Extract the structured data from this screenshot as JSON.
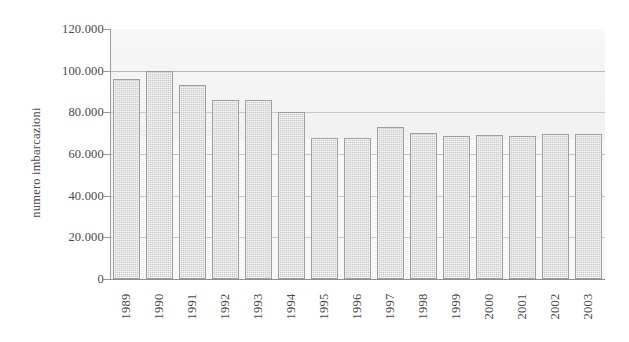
{
  "chart_data": {
    "type": "bar",
    "title": "",
    "subtitle": "",
    "xlabel": "",
    "ylabel": "numero imbarcazioni",
    "categories": [
      "1989",
      "1990",
      "1991",
      "1992",
      "1993",
      "1994",
      "1995",
      "1996",
      "1997",
      "1998",
      "1999",
      "2000",
      "2001",
      "2002",
      "2003"
    ],
    "values": [
      96000,
      100000,
      93000,
      86000,
      86000,
      80000,
      67500,
      67500,
      73000,
      70000,
      68500,
      69000,
      68500,
      69500,
      69500
    ],
    "ylim": [
      0,
      120000
    ],
    "ytick_values": [
      0,
      20000,
      40000,
      60000,
      80000,
      100000,
      120000
    ],
    "ytick_labels": [
      "0",
      "20.000",
      "40.000",
      "60.000",
      "80.000",
      "100.000",
      "120.000"
    ],
    "grid": true,
    "grid_axis": "y",
    "legend": false,
    "legend_position": "none",
    "series": [
      {
        "name": "numero imbarcazioni",
        "values": [
          96000,
          100000,
          93000,
          86000,
          86000,
          80000,
          67500,
          67500,
          73000,
          70000,
          68500,
          69000,
          68500,
          69500,
          69500
        ]
      }
    ]
  },
  "style": {
    "bar_fill": "#c9c9c9",
    "bar_border": "#9f9f9f",
    "plot_background": "#f2f2f2",
    "gridline_color": "#b9b9b9",
    "axis_color": "#9a9a9a",
    "text_color": "#4a4a4a",
    "page_background": "#ffffff"
  }
}
